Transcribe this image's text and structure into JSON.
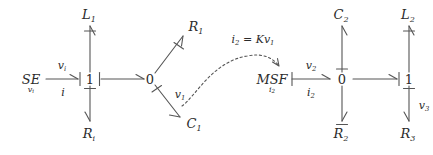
{
  "diagram": {
    "type": "bond-graph",
    "title_text": "",
    "background_color": "#ffffff",
    "stroke_color": "#555555",
    "text_color": "#2b2b2b",
    "elements": {
      "source_effort": {
        "label": "SE",
        "subscript": "v",
        "subscript2": "i"
      },
      "junction_1_left": {
        "label": "1"
      },
      "junction_0_left": {
        "label": "0"
      },
      "inductor_1": {
        "label": "L",
        "subscript": "1"
      },
      "resistor_i": {
        "label": "R",
        "subscript": "i"
      },
      "resistor_1": {
        "label": "R",
        "subscript": "1"
      },
      "capacitor_1": {
        "label": "C",
        "subscript": "1"
      },
      "modulated_source_flow": {
        "label": "MSF",
        "subscript": "i",
        "subscript2": "2"
      },
      "junction_0_right": {
        "label": "0"
      },
      "junction_1_right": {
        "label": "1"
      },
      "capacitor_2": {
        "label": "C",
        "subscript": "2"
      },
      "resistor_2": {
        "label": "R",
        "subscript": "2"
      },
      "inductor_2": {
        "label": "L",
        "subscript": "2"
      },
      "resistor_3": {
        "label": "R",
        "subscript": "3"
      }
    },
    "bond_labels": {
      "se_to_1_effort": {
        "text": "v",
        "sub": "i"
      },
      "se_to_1_flow": {
        "text": "i",
        "sub": ""
      },
      "zero_to_c1": {
        "text": "v",
        "sub": "1"
      },
      "msf_to_0_effort": {
        "text": "v",
        "sub": "2"
      },
      "msf_to_0_flow": {
        "text": "i",
        "sub": "2"
      },
      "one_to_r3": {
        "text": "v",
        "sub": "3"
      }
    },
    "modulation": {
      "equation_lhs": "i",
      "equation_lhs_sub": "2",
      "equation_op": " = K",
      "equation_rhs": "v",
      "equation_rhs_sub": "1",
      "arrow_style": "dashed-curved"
    }
  }
}
